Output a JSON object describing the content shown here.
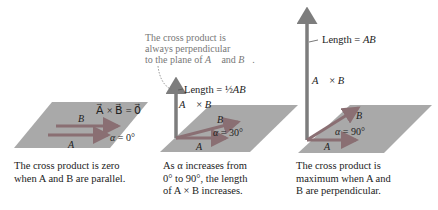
{
  "panels": [
    {
      "alpha_label": "α = 0°",
      "result_label": "A × B = 0",
      "vec_a": "A",
      "vec_b": "B",
      "caption_lines": [
        "The cross product is zero",
        "when A and B are parallel."
      ]
    },
    {
      "alpha_label": "α = 30°",
      "cross_label": "A × B",
      "length_label": "Length = ½AB",
      "vec_a": "A",
      "vec_b": "B",
      "note_lines": [
        "The cross product is",
        "always perpendicular",
        "to the plane of A and B."
      ],
      "caption_lines": [
        "As α increases from",
        "0° to 90°, the length",
        "of A × B increases."
      ]
    },
    {
      "alpha_label": "α = 90°",
      "cross_label": "A × B",
      "length_label": "Length = AB",
      "vec_a": "A",
      "vec_b": "B",
      "caption_lines": [
        "The cross product is",
        "maximum when A and",
        "B are perpendicular."
      ]
    }
  ],
  "colors": {
    "plane": "#a9a9a9",
    "vector": "#8a6f73",
    "cross_vector": "#7d7d7d",
    "text": "#222222",
    "note": "#777777"
  }
}
